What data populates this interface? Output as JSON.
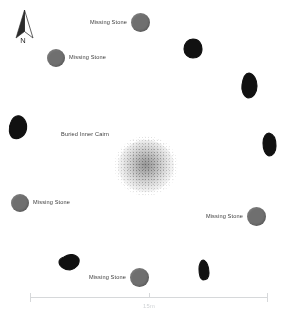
{
  "plan": {
    "title": "Stone Circle Site Plan",
    "background_color": "#ffffff"
  },
  "compass": {
    "icon": "north-arrow-icon",
    "label": "N"
  },
  "cairn": {
    "label": "Buried Inner Cairn",
    "fill_color": "#8c8c8c"
  },
  "missing_stone_color": "#6f6f6f",
  "surviving_stone_color": "#111111",
  "missing_stones": [
    {
      "label": "Missing Stone",
      "label_side": "left",
      "x": 131,
      "y": 13,
      "size": 19
    },
    {
      "label": "Missing Stone",
      "label_side": "right",
      "x": 47,
      "y": 49,
      "size": 18
    },
    {
      "label": "Missing Stone",
      "label_side": "right",
      "x": 11,
      "y": 194,
      "size": 18
    },
    {
      "label": "Missing Stone",
      "label_side": "left",
      "x": 247,
      "y": 207,
      "size": 19
    },
    {
      "label": "Missing Stone",
      "label_side": "left",
      "x": 130,
      "y": 268,
      "size": 19
    }
  ],
  "surviving_stones": [
    {
      "name": "stone-north-east",
      "x": 183,
      "y": 38,
      "w": 20,
      "h": 21
    },
    {
      "name": "stone-east-upper",
      "x": 240,
      "y": 72,
      "w": 18,
      "h": 27
    },
    {
      "name": "stone-east",
      "x": 262,
      "y": 132,
      "w": 15,
      "h": 25
    },
    {
      "name": "stone-west",
      "x": 7,
      "y": 114,
      "w": 22,
      "h": 26
    },
    {
      "name": "stone-south-west",
      "x": 58,
      "y": 252,
      "w": 22,
      "h": 19
    },
    {
      "name": "stone-south-east",
      "x": 196,
      "y": 259,
      "w": 14,
      "h": 22
    }
  ],
  "scale": {
    "label": "15m",
    "line_color": "#d6d8da"
  }
}
